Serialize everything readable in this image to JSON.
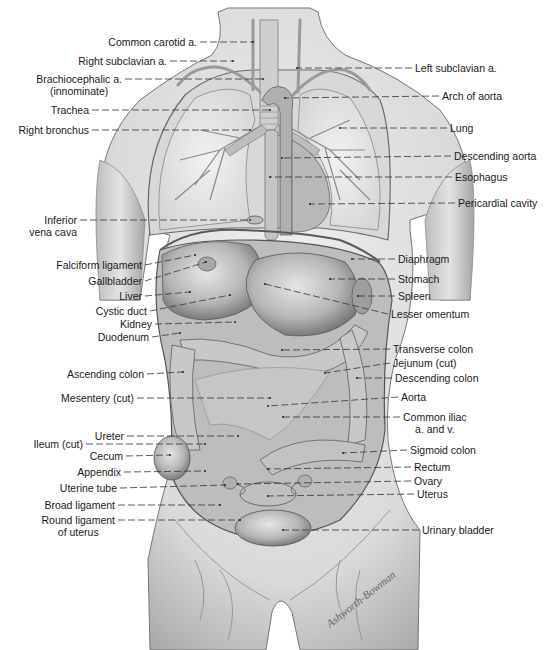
{
  "figure": {
    "signature": "Ashworth-Bowman",
    "colors": {
      "skin": "#e2e2e2",
      "skin_shadow": "#9c9c9c",
      "organ": "#c4c4c4",
      "organ_dark": "#7a7a7a",
      "line": "#333333",
      "text": "#1a1a1a"
    }
  },
  "labels_left": [
    {
      "id": "common-carotid",
      "text": "Common carotid a.",
      "x": 200,
      "y": 42,
      "tx": 253,
      "ty": 42
    },
    {
      "id": "right-subclavian",
      "text": "Right subclavian a.",
      "x": 170,
      "y": 61,
      "tx": 233,
      "ty": 61
    },
    {
      "id": "brachiocephalic",
      "text": "Brachiocephalic a.",
      "text2": "(innominate)",
      "x": 125,
      "y": 79,
      "tx": 263,
      "ty": 79
    },
    {
      "id": "trachea",
      "text": "Trachea",
      "x": 92,
      "y": 110,
      "tx": 270,
      "ty": 110
    },
    {
      "id": "right-bronchus",
      "text": "Right bronchus",
      "x": 92,
      "y": 130,
      "tx": 250,
      "ty": 130
    },
    {
      "id": "inferior-vena-cava",
      "text": "Inferior",
      "text2": "vena cava",
      "x": 80,
      "y": 220,
      "tx": 250,
      "ty": 220
    },
    {
      "id": "falciform-ligament",
      "text": "Falciform ligament",
      "x": 145,
      "y": 265,
      "tx": 195,
      "ty": 255
    },
    {
      "id": "gallbladder",
      "text": "Gallbladder",
      "x": 145,
      "y": 281,
      "tx": 206,
      "ty": 262
    },
    {
      "id": "liver",
      "text": "Liver",
      "x": 145,
      "y": 296,
      "tx": 190,
      "ty": 292
    },
    {
      "id": "cystic-duct",
      "text": "Cystic duct",
      "x": 150,
      "y": 311,
      "tx": 230,
      "ty": 295
    },
    {
      "id": "kidney",
      "text": "Kidney",
      "x": 155,
      "y": 324,
      "tx": 235,
      "ty": 322
    },
    {
      "id": "duodenum",
      "text": "Duodenum",
      "x": 152,
      "y": 337,
      "tx": 180,
      "ty": 333
    },
    {
      "id": "ascending-colon",
      "text": "Ascending colon",
      "x": 147,
      "y": 374,
      "tx": 183,
      "ty": 372
    },
    {
      "id": "mesentery",
      "text": "Mesentery (cut)",
      "x": 137,
      "y": 398,
      "tx": 270,
      "ty": 398
    },
    {
      "id": "ureter",
      "text": "Ureter",
      "x": 127,
      "y": 436,
      "tx": 238,
      "ty": 436
    },
    {
      "id": "ileum",
      "text": "Ileum (cut)",
      "x": 86,
      "y": 444,
      "tx": 205,
      "ty": 444
    },
    {
      "id": "cecum",
      "text": "Cecum",
      "x": 126,
      "y": 456,
      "tx": 170,
      "ty": 455
    },
    {
      "id": "appendix",
      "text": "Appendix",
      "x": 124,
      "y": 472,
      "tx": 205,
      "ty": 471
    },
    {
      "id": "uterine-tube",
      "text": "Uterine tube",
      "x": 120,
      "y": 488,
      "tx": 225,
      "ty": 485
    },
    {
      "id": "broad-ligament",
      "text": "Broad ligament",
      "x": 118,
      "y": 505,
      "tx": 220,
      "ty": 505
    },
    {
      "id": "round-ligament",
      "text": "Round ligament",
      "text2": "of uterus",
      "x": 118,
      "y": 520,
      "tx": 240,
      "ty": 520
    }
  ],
  "labels_right": [
    {
      "id": "left-subclavian",
      "text": "Left subclavian a.",
      "x": 412,
      "y": 68,
      "tx": 297,
      "ty": 68
    },
    {
      "id": "arch-of-aorta",
      "text": "Arch of aorta",
      "x": 439,
      "y": 96,
      "tx": 285,
      "ty": 98
    },
    {
      "id": "lung",
      "text": "Lung",
      "x": 447,
      "y": 128,
      "tx": 340,
      "ty": 128
    },
    {
      "id": "descending-aorta",
      "text": "Descending aorta",
      "x": 451,
      "y": 156,
      "tx": 282,
      "ty": 158
    },
    {
      "id": "esophagus",
      "text": "Esophagus",
      "x": 452,
      "y": 177,
      "tx": 270,
      "ty": 177
    },
    {
      "id": "pericardial-cavity",
      "text": "Pericardial cavity",
      "x": 455,
      "y": 203,
      "tx": 310,
      "ty": 204
    },
    {
      "id": "diaphragm",
      "text": "Diaphragm",
      "x": 395,
      "y": 259,
      "tx": 352,
      "ty": 259
    },
    {
      "id": "stomach",
      "text": "Stomach",
      "x": 395,
      "y": 279,
      "tx": 330,
      "ty": 279
    },
    {
      "id": "spleen",
      "text": "Spleen",
      "x": 395,
      "y": 296,
      "tx": 358,
      "ty": 296
    },
    {
      "id": "lesser-omentum",
      "text": "Lesser omentum",
      "x": 388,
      "y": 314,
      "tx": 265,
      "ty": 284
    },
    {
      "id": "transverse-colon",
      "text": "Transverse colon",
      "x": 390,
      "y": 349,
      "tx": 282,
      "ty": 350
    },
    {
      "id": "jejunum",
      "text": "Jejunum (cut)",
      "x": 390,
      "y": 363,
      "tx": 325,
      "ty": 373
    },
    {
      "id": "descending-colon",
      "text": "Descending colon",
      "x": 392,
      "y": 378,
      "tx": 357,
      "ty": 378
    },
    {
      "id": "aorta",
      "text": "Aorta",
      "x": 398,
      "y": 397,
      "tx": 268,
      "ty": 406
    },
    {
      "id": "common-iliac",
      "text": "Common iliac",
      "text2": "a. and v.",
      "x": 400,
      "y": 417,
      "tx": 283,
      "ty": 417
    },
    {
      "id": "sigmoid-colon",
      "text": "Sigmoid colon",
      "x": 407,
      "y": 450,
      "tx": 343,
      "ty": 453
    },
    {
      "id": "rectum",
      "text": "Rectum",
      "x": 411,
      "y": 467,
      "tx": 268,
      "ty": 469
    },
    {
      "id": "ovary",
      "text": "Ovary",
      "x": 411,
      "y": 481,
      "tx": 238,
      "ty": 484
    },
    {
      "id": "uterus",
      "text": "Uterus",
      "x": 414,
      "y": 494,
      "tx": 268,
      "ty": 496
    },
    {
      "id": "urinary-bladder",
      "text": "Urinary bladder",
      "x": 419,
      "y": 530,
      "tx": 283,
      "ty": 530
    }
  ]
}
